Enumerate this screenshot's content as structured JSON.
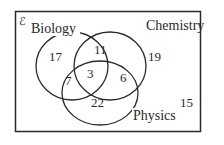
{
  "diagram": {
    "type": "venn-3",
    "universal_symbol": "ℰ",
    "sets": [
      {
        "name": "Biology"
      },
      {
        "name": "Chemistry"
      },
      {
        "name": "Physics"
      }
    ],
    "regions": {
      "biology_only": "17",
      "chemistry_only": "19",
      "physics_only": "22",
      "biology_chemistry_only": "11",
      "biology_physics_only": "7",
      "chemistry_physics_only": "6",
      "all_three": "3",
      "outside": "15"
    },
    "colors": {
      "line": "#2a2a2a",
      "background": "#ffffff"
    }
  }
}
